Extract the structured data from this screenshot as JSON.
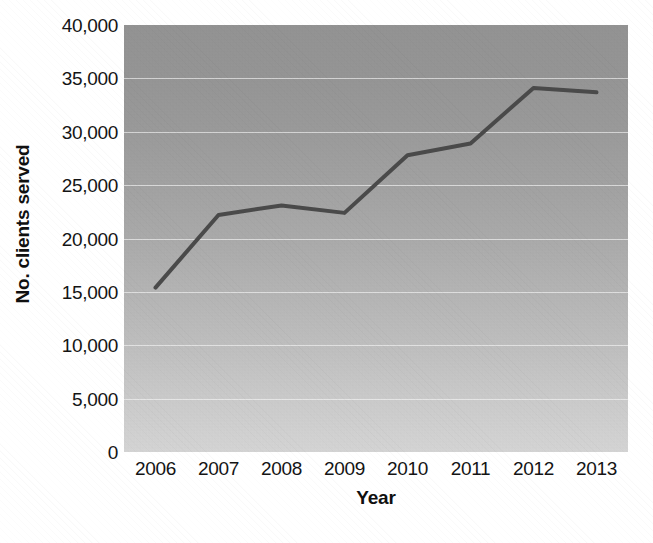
{
  "chart_data": {
    "type": "line",
    "title": "",
    "xlabel": "Year",
    "ylabel": "No. clients served",
    "categories": [
      "2006",
      "2007",
      "2008",
      "2009",
      "2010",
      "2011",
      "2012",
      "2013"
    ],
    "x": [
      2006,
      2007,
      2008,
      2009,
      2010,
      2011,
      2012,
      2013
    ],
    "values": [
      15400,
      22200,
      23100,
      22400,
      27800,
      28900,
      34100,
      33700
    ],
    "series": [
      {
        "name": "No. clients served",
        "values": [
          15400,
          22200,
          23100,
          22400,
          27800,
          28900,
          34100,
          33700
        ]
      }
    ],
    "ylim": [
      0,
      40000
    ],
    "yticks": [
      0,
      5000,
      10000,
      15000,
      20000,
      25000,
      30000,
      35000,
      40000
    ],
    "ytick_labels": [
      "0",
      "5,000",
      "10,000",
      "15,000",
      "20,000",
      "25,000",
      "30,000",
      "35,000",
      "40,000"
    ],
    "xtick_labels": [
      "2006",
      "2007",
      "2008",
      "2009",
      "2010",
      "2011",
      "2012",
      "2013"
    ],
    "grid": true,
    "grid_axis": "y",
    "grid_color": "#ffffff",
    "legend": false,
    "legend_position": "none",
    "line_color": "#4a4a4a",
    "line_width": 4,
    "markers": false,
    "plot_background": "gray-vertical-gradient",
    "plot_background_top_color": "#949494",
    "plot_background_bottom_color": "#d8d8d8",
    "figure_background": "#ffffff",
    "text_color": "#141414"
  }
}
